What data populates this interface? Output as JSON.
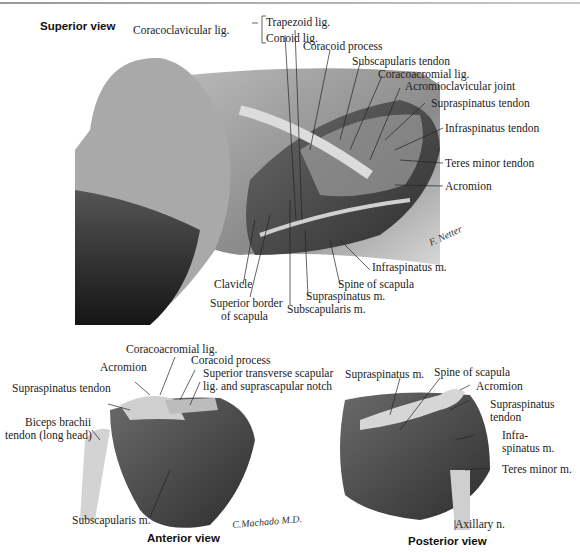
{
  "figure": {
    "panels": [
      {
        "id": "superior",
        "title": "Superior view",
        "labels": {
          "coracoclavicular": "Coracoclavicular lig.",
          "trapezoid": "Trapezoid lig.",
          "conoid": "Conoid lig.",
          "coracoid_process": "Coracoid process",
          "subscapularis_tendon": "Subscapularis tendon",
          "coracoacromial": "Coracoacromial lig.",
          "acromioclavicular": "Acromioclavicular joint",
          "supraspinatus_tendon": "Supraspinatus tendon",
          "infraspinatus_tendon": "Infraspinatus tendon",
          "teres_minor_tendon": "Teres minor tendon",
          "acromion": "Acromion",
          "infraspinatus_m": "Infraspinatus m.",
          "spine_of_scapula": "Spine of scapula",
          "supraspinatus_m": "Supraspinatus m.",
          "subscapularis_m": "Subscapularis m.",
          "clavicle": "Clavicle",
          "superior_border_1": "Superior border",
          "superior_border_2": "of scapula"
        },
        "signature": "F. Netter"
      },
      {
        "id": "anterior",
        "title": "Anterior view",
        "labels": {
          "coracoacromial": "Coracoacromial lig.",
          "coracoid_process": "Coracoid process",
          "acromion": "Acromion",
          "superior_transverse_1": "Superior transverse scapular",
          "superior_transverse_2": "lig. and suprascapular notch",
          "supraspinatus_tendon": "Supraspinatus tendon",
          "biceps_1": "Biceps brachii",
          "biceps_2": "tendon (long head)",
          "subscapularis_m": "Subscapularis m."
        },
        "signature": "C.Machado M.D."
      },
      {
        "id": "posterior",
        "title": "Posterior view",
        "labels": {
          "supraspinatus_m": "Supraspinatus m.",
          "spine_of_scapula": "Spine of scapula",
          "acromion": "Acromion",
          "supraspinatus_tendon_1": "Supraspinatus",
          "supraspinatus_tendon_2": "tendon",
          "infraspinatus_1": "Infra-",
          "infraspinatus_2": "spinatus m.",
          "teres_minor": "Teres minor m.",
          "axillary": "Axillary n."
        }
      }
    ]
  }
}
